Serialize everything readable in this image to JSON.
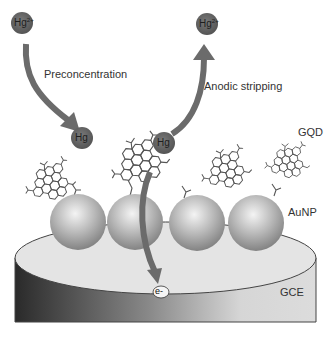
{
  "diagram": {
    "labels": {
      "preconcentration": "Preconcentration",
      "anodic_stripping": "Anodic stripping",
      "gqd": "GQD",
      "aunp": "AuNP",
      "gce": "GCE",
      "electron": "e-"
    },
    "ions": {
      "hg2_left": {
        "base": "Hg",
        "charge": "2+"
      },
      "hg2_right": {
        "base": "Hg",
        "charge": "2+"
      },
      "hg_left": {
        "base": "Hg"
      },
      "hg_right": {
        "base": "Hg"
      }
    },
    "colors": {
      "arrow": "#6b6b6b",
      "ion_fill": "#5f5f5f",
      "electrode_top": "#e6e6e6",
      "electrode_side_dark": "#2e2e2e",
      "electrode_side_light": "#d8d8d8",
      "sphere": "#b5b5b5",
      "molecule": "#555555"
    }
  }
}
